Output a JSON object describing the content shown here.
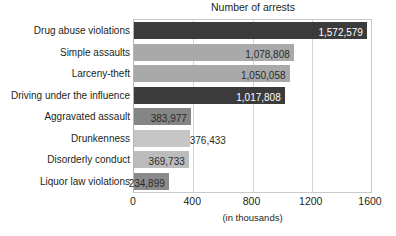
{
  "chart_data": {
    "type": "bar",
    "orientation": "horizontal",
    "title": "Number of arrests",
    "xlabel": "(in thousands)",
    "ylabel": "",
    "xlim": [
      0,
      1600
    ],
    "xticks": [
      0,
      400,
      800,
      1200,
      1600
    ],
    "xtick_labels": [
      "0",
      "400",
      "800",
      "1200",
      "1600"
    ],
    "grid": "vertical",
    "legend": "none",
    "units": "thousands",
    "categories": [
      "Drug abuse violations",
      "Simple assaults",
      "Larceny-theft",
      "Driving under the influence",
      "Aggravated assault",
      "Drunkenness",
      "Disorderly conduct",
      "Liquor law violations"
    ],
    "values": [
      1572.579,
      1078.808,
      1050.058,
      1017.808,
      383.977,
      376.433,
      369.733,
      234.899
    ],
    "data_labels": [
      "1,572,579",
      "1,078,808",
      "1,050,058",
      "1,017,808",
      "383,977",
      "376,433",
      "369,733",
      "234,899"
    ],
    "bar_colors": [
      "#3b3b3b",
      "#a9a9a9",
      "#a9a9a9",
      "#3b3b3b",
      "#858585",
      "#c6c6c6",
      "#bcbcbc",
      "#8a8a8a"
    ],
    "label_colors": [
      "#ffffff",
      "#2b2b2b",
      "#2b2b2b",
      "#ffffff",
      "#2b2b2b",
      "#2b2b2b",
      "#2b2b2b",
      "#2b2b2b"
    ],
    "label_positions": [
      "inside-end",
      "inside-end",
      "inside-end",
      "inside-end",
      "inside-end",
      "outside-end",
      "inside-end",
      "inside-end"
    ],
    "bars": [
      {
        "category": "Drug abuse violations",
        "value": 1572.579,
        "label": "1,572,579",
        "color": "#3b3b3b",
        "label_color": "#ffffff",
        "label_position": "inside-end"
      },
      {
        "category": "Simple assaults",
        "value": 1078.808,
        "label": "1,078,808",
        "color": "#a9a9a9",
        "label_color": "#2b2b2b",
        "label_position": "inside-end"
      },
      {
        "category": "Larceny-theft",
        "value": 1050.058,
        "label": "1,050,058",
        "color": "#a9a9a9",
        "label_color": "#2b2b2b",
        "label_position": "inside-end"
      },
      {
        "category": "Driving under the influence",
        "value": 1017.808,
        "label": "1,017,808",
        "color": "#3b3b3b",
        "label_color": "#ffffff",
        "label_position": "inside-end"
      },
      {
        "category": "Aggravated assault",
        "value": 383.977,
        "label": "383,977",
        "color": "#858585",
        "label_color": "#2b2b2b",
        "label_position": "inside-end"
      },
      {
        "category": "Drunkenness",
        "value": 376.433,
        "label": "376,433",
        "color": "#c6c6c6",
        "label_color": "#2b2b2b",
        "label_position": "outside-end"
      },
      {
        "category": "Disorderly conduct",
        "value": 369.733,
        "label": "369,733",
        "color": "#bcbcbc",
        "label_color": "#2b2b2b",
        "label_position": "inside-end"
      },
      {
        "category": "Liquor law violations",
        "value": 234.899,
        "label": "234,899",
        "color": "#8a8a8a",
        "label_color": "#2b2b2b",
        "label_position": "inside-end"
      }
    ]
  },
  "colors": {
    "background": "#ffffff",
    "text": "#231f20",
    "gridline": "#d5d5d5",
    "frame": "#c9c9c9",
    "bar_dark": "#3b3b3b",
    "bar_light": "#a9a9a9"
  }
}
